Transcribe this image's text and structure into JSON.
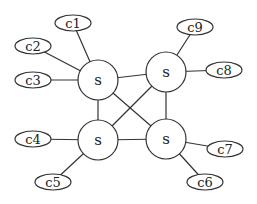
{
  "diagram": {
    "stroke_color": "#333333",
    "background": "#ffffff",
    "servers": [
      {
        "id": "s_tl",
        "label": "s",
        "cx": 98,
        "cy": 80,
        "r": 20
      },
      {
        "id": "s_tr",
        "label": "s",
        "cx": 166,
        "cy": 72,
        "r": 20
      },
      {
        "id": "s_bl",
        "label": "s",
        "cx": 98,
        "cy": 140,
        "r": 20
      },
      {
        "id": "s_br",
        "label": "s",
        "cx": 166,
        "cy": 139,
        "r": 20
      }
    ],
    "clients": [
      {
        "id": "c1",
        "label": "c1",
        "cx": 73,
        "cy": 23,
        "rx": 18,
        "ry": 8,
        "server": "s_tl"
      },
      {
        "id": "c2",
        "label": "c2",
        "cx": 33,
        "cy": 46,
        "rx": 18,
        "ry": 8,
        "server": "s_tl"
      },
      {
        "id": "c3",
        "label": "c3",
        "cx": 33,
        "cy": 80,
        "rx": 18,
        "ry": 8,
        "server": "s_tl"
      },
      {
        "id": "c4",
        "label": "c4",
        "cx": 33,
        "cy": 139,
        "rx": 18,
        "ry": 8,
        "server": "s_bl"
      },
      {
        "id": "c5",
        "label": "c5",
        "cx": 53,
        "cy": 182,
        "rx": 18,
        "ry": 8,
        "server": "s_bl"
      },
      {
        "id": "c6",
        "label": "c6",
        "cx": 205,
        "cy": 182,
        "rx": 18,
        "ry": 8,
        "server": "s_br"
      },
      {
        "id": "c7",
        "label": "c7",
        "cx": 225,
        "cy": 149,
        "rx": 18,
        "ry": 8,
        "server": "s_br"
      },
      {
        "id": "c8",
        "label": "c8",
        "cx": 224,
        "cy": 70,
        "rx": 18,
        "ry": 8,
        "server": "s_tr"
      },
      {
        "id": "c9",
        "label": "c9",
        "cx": 195,
        "cy": 27,
        "rx": 18,
        "ry": 8,
        "server": "s_tr"
      }
    ],
    "server_links": [
      [
        "s_tl",
        "s_tr"
      ],
      [
        "s_bl",
        "s_br"
      ],
      [
        "s_tl",
        "s_bl"
      ],
      [
        "s_tr",
        "s_br"
      ],
      [
        "s_tl",
        "s_br"
      ],
      [
        "s_tr",
        "s_bl"
      ]
    ]
  }
}
